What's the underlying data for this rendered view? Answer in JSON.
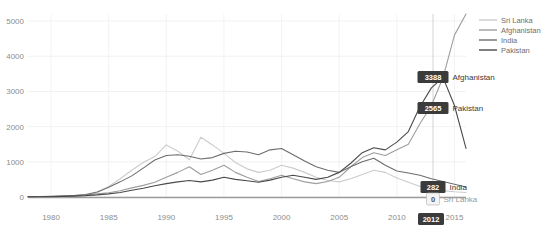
{
  "chart_data": {
    "type": "line",
    "title": "",
    "xlabel": "",
    "ylabel": "",
    "xlim": [
      1978,
      2016
    ],
    "ylim": [
      0,
      5200
    ],
    "grid": true,
    "legend_position": "top-right",
    "yticks": [
      "5000",
      "4000",
      "3000",
      "2000",
      "1000",
      "0"
    ],
    "ytick_values": [
      5000,
      4000,
      3000,
      2000,
      1000,
      0
    ],
    "xticks": [
      "1980",
      "1985",
      "1990",
      "1995",
      "2000",
      "2005",
      "2010",
      "2015"
    ],
    "xtick_values": [
      1980,
      1985,
      1990,
      1995,
      2000,
      2005,
      2010,
      2015
    ],
    "x": [
      1978,
      1979,
      1980,
      1981,
      1982,
      1983,
      1984,
      1985,
      1986,
      1987,
      1988,
      1989,
      1990,
      1991,
      1992,
      1993,
      1994,
      1995,
      1996,
      1997,
      1998,
      1999,
      2000,
      2001,
      2002,
      2003,
      2004,
      2005,
      2006,
      2007,
      2008,
      2009,
      2010,
      2011,
      2012,
      2013,
      2014,
      2015,
      2016
    ],
    "series": [
      {
        "name": "Sri Lanka",
        "color": "#cccccc",
        "values": [
          5,
          6,
          8,
          10,
          14,
          40,
          120,
          300,
          520,
          760,
          980,
          1150,
          1480,
          1300,
          1060,
          1700,
          1480,
          1240,
          980,
          800,
          700,
          760,
          900,
          820,
          700,
          560,
          470,
          430,
          520,
          640,
          760,
          700,
          540,
          420,
          300,
          230,
          180,
          150,
          130
        ]
      },
      {
        "name": "Afghanistan",
        "color": "#9e9e9e",
        "values": [
          8,
          10,
          16,
          26,
          40,
          60,
          90,
          120,
          180,
          260,
          330,
          420,
          560,
          700,
          860,
          640,
          760,
          900,
          700,
          560,
          440,
          520,
          620,
          520,
          430,
          380,
          440,
          560,
          860,
          1120,
          1260,
          1180,
          1340,
          1500,
          2080,
          2600,
          3388,
          4600,
          5200
        ]
      },
      {
        "name": "India",
        "color": "#6d6d6d",
        "values": [
          12,
          16,
          22,
          30,
          44,
          70,
          140,
          280,
          430,
          600,
          820,
          1050,
          1180,
          1200,
          1160,
          1080,
          1120,
          1240,
          1300,
          1280,
          1200,
          1340,
          1380,
          1200,
          1020,
          860,
          760,
          700,
          860,
          1000,
          1100,
          900,
          740,
          680,
          620,
          520,
          440,
          360,
          282
        ]
      },
      {
        "name": "Pakistan",
        "color": "#4a4a4a",
        "values": [
          6,
          8,
          12,
          18,
          26,
          38,
          60,
          90,
          130,
          190,
          250,
          320,
          380,
          430,
          470,
          430,
          480,
          560,
          500,
          460,
          420,
          480,
          560,
          620,
          560,
          500,
          560,
          700,
          960,
          1260,
          1400,
          1340,
          1560,
          1860,
          2565,
          3100,
          3400,
          2600,
          1380
        ]
      }
    ],
    "legend": [
      {
        "label": "Sri Lanka",
        "color": "#cccccc"
      },
      {
        "label": "Afghanistan",
        "color": "#9e9e9e"
      },
      {
        "label": "India",
        "color": "#6d6d6d"
      },
      {
        "label": "Pakistan",
        "color": "#4a4a4a"
      }
    ],
    "hover_year": "2012",
    "annotations": [
      {
        "value": "3388",
        "label": "Afghanistan",
        "series": "Afghanistan",
        "style": "dark"
      },
      {
        "value": "2565",
        "label": "Pakistan",
        "series": "Pakistan",
        "style": "dark"
      },
      {
        "value": "282",
        "label": "India",
        "series": "India",
        "style": "dark"
      },
      {
        "value": "0",
        "label": "Sri Lanka",
        "series": "Sri Lanka",
        "style": "light"
      }
    ]
  }
}
